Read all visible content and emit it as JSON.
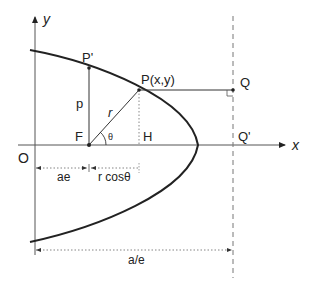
{
  "diagram": {
    "colors": {
      "stroke": "#222222",
      "axis": "#555555",
      "dashed": "#777777",
      "dotted": "#888888"
    },
    "axes": {
      "x_label": "x",
      "y_label": "y",
      "origin_label": "O"
    },
    "points": {
      "focus": "F",
      "p_prime": "P'",
      "p": "P(x,y)",
      "h": "H",
      "q": "Q",
      "q_prime": "Q'"
    },
    "segments": {
      "semi_latus_rectum": "p",
      "radius": "r",
      "angle": "θ"
    },
    "dimensions": {
      "ae": "ae",
      "r_cos": "r cosθ",
      "a_over_e": "a/e"
    }
  }
}
